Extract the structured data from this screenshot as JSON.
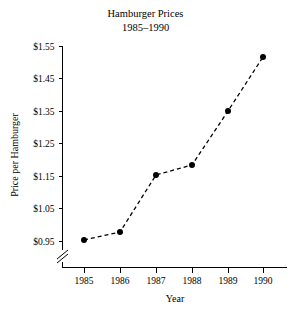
{
  "chart_data": {
    "type": "line",
    "title": "Hamburger Prices",
    "subtitle": "1985–1990",
    "xlabel": "Year",
    "ylabel": "Price per Hamburger",
    "categories": [
      "1985",
      "1986",
      "1987",
      "1988",
      "1989",
      "1990"
    ],
    "x": [
      1985,
      1986,
      1987,
      1988,
      1989,
      1990
    ],
    "values": [
      0.95,
      0.975,
      1.15,
      1.18,
      1.345,
      1.51
    ],
    "ylim": [
      0.95,
      1.55
    ],
    "xlim": [
      1985,
      1990
    ],
    "yticks": [
      0.95,
      1.05,
      1.15,
      1.25,
      1.35,
      1.45,
      1.55
    ],
    "ytick_labels": [
      "$0.95",
      "$1.05",
      "$1.15",
      "$1.25",
      "$1.35",
      "$1.45",
      "$1.55"
    ],
    "xtick_labels": [
      "1985",
      "1986",
      "1987",
      "1988",
      "1989",
      "1990"
    ],
    "grid": false,
    "legend": false,
    "legend_position": "none",
    "axis_break": {
      "axis": "y",
      "present": true,
      "note": "y-axis broken below $0.95"
    },
    "line_style": "dashed",
    "marker": "filled-circle",
    "series_color": "#000000",
    "background_color": "#ffffff"
  },
  "series_points": [
    {
      "label": "1985",
      "value": "$0.95",
      "cx": 84,
      "cy": 240
    },
    {
      "label": "1986",
      "value": "$0.975",
      "cx": 120,
      "cy": 232
    },
    {
      "label": "1987",
      "value": "$1.15",
      "cx": 156,
      "cy": 175
    },
    {
      "label": "1988",
      "value": "$1.18",
      "cx": 192,
      "cy": 165
    },
    {
      "label": "1989",
      "value": "$1.345",
      "cx": 228,
      "cy": 111
    },
    {
      "label": "1990",
      "value": "$1.51",
      "cx": 263,
      "cy": 57
    }
  ],
  "y_axis_rows": [
    {
      "label": "$1.55",
      "y": 46
    },
    {
      "label": "$1.45",
      "y": 78.5
    },
    {
      "label": "$1.35",
      "y": 111
    },
    {
      "label": "$1.25",
      "y": 143.5
    },
    {
      "label": "$1.15",
      "y": 176
    },
    {
      "label": "$1.05",
      "y": 208.5
    },
    {
      "label": "$0.95",
      "y": 241
    }
  ],
  "x_axis_cols": [
    {
      "label": "1985",
      "x": 84
    },
    {
      "label": "1986",
      "x": 120
    },
    {
      "label": "1987",
      "x": 156
    },
    {
      "label": "1988",
      "x": 192
    },
    {
      "label": "1989",
      "x": 228
    },
    {
      "label": "1990",
      "x": 263
    }
  ]
}
